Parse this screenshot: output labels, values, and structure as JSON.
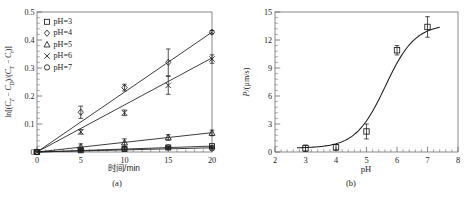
{
  "figure": {
    "panel_a_caption": "(a)",
    "panel_b_caption": "(b)"
  },
  "chart_data": [
    {
      "id": "panel-a",
      "type": "scatter",
      "title": "",
      "xlabel": "时间/min",
      "ylabel": "ln[(CT − CD)/(CT − Ct)]",
      "ylabel_parts": {
        "prefix": "ln[(",
        "c1_base": "C",
        "c1_sub": "T",
        "minus1": " − ",
        "c2_base": "C",
        "c2_sub": "D",
        "slash": ")/(",
        "c3_base": "C",
        "c3_sub": "T",
        "minus2": " − ",
        "c4_base": "C",
        "c4_sub": "t",
        "suffix": ")]"
      },
      "xlim": [
        0,
        20
      ],
      "ylim": [
        0,
        0.5
      ],
      "xticks": [
        0,
        5,
        10,
        15,
        20
      ],
      "xticklabels": [
        "0",
        "5",
        "10",
        "15",
        "20"
      ],
      "yticks": [
        0,
        0.1,
        0.2,
        0.3,
        0.4,
        0.5
      ],
      "yticklabels": [
        "0",
        "0.1",
        "0.2",
        "0.3",
        "0.4",
        "0.5"
      ],
      "minor_ticks": true,
      "grid": false,
      "legend_position": "upper-left",
      "x": [
        0,
        5,
        10,
        15,
        20
      ],
      "series": [
        {
          "name": "pH=3",
          "marker": "square",
          "values": [
            0,
            0.006,
            0.011,
            0.016,
            0.021
          ],
          "errors": [
            0,
            0.004,
            0.004,
            0.004,
            0.003
          ],
          "fit_slope": 0.00105,
          "fit_intercept": 0
        },
        {
          "name": "pH=4",
          "marker": "diamond",
          "values": [
            0,
            0.142,
            0.23,
            0.32,
            0.428
          ],
          "errors": [
            0,
            0.022,
            0.012,
            0.048,
            0.006
          ],
          "fit_slope": 0.0214,
          "fit_intercept": 0
        },
        {
          "name": "pH=5",
          "marker": "triangle",
          "values": [
            0,
            0.019,
            0.034,
            0.052,
            0.068
          ],
          "errors": [
            0,
            0.01,
            0.013,
            0.01,
            0.01
          ],
          "fit_slope": 0.00345,
          "fit_intercept": 0
        },
        {
          "name": "pH=6",
          "marker": "cross",
          "values": [
            0,
            0.072,
            0.14,
            0.238,
            0.332
          ],
          "errors": [
            0,
            0.008,
            0.01,
            0.032,
            0.015
          ],
          "fit_slope": 0.0168,
          "fit_intercept": 0
        },
        {
          "name": "pH=7",
          "marker": "circle",
          "values": [
            0,
            0.007,
            0.012,
            0.017,
            0.013
          ],
          "errors": [
            0,
            0.003,
            0.003,
            0.003,
            0.003
          ],
          "fit_slope": 0.00075,
          "fit_intercept": 0
        }
      ]
    },
    {
      "id": "panel-b",
      "type": "line",
      "title": "",
      "xlabel": "pH",
      "ylabel": "P/(μm/s)",
      "ylabel_parts": {
        "symbol": "P",
        "units": "/(μm/s)"
      },
      "xlim": [
        2,
        8
      ],
      "ylim": [
        0,
        15
      ],
      "xticks": [
        2,
        3,
        4,
        5,
        6,
        7,
        8
      ],
      "xticklabels": [
        "2",
        "3",
        "4",
        "5",
        "6",
        "7",
        "8"
      ],
      "yticks": [
        0,
        3,
        6,
        9,
        12,
        15
      ],
      "yticklabels": [
        "0",
        "3",
        "6",
        "9",
        "12",
        "15"
      ],
      "minor_ticks": true,
      "grid": false,
      "legend_position": "none",
      "marker": "square",
      "x": [
        3,
        4,
        5,
        6,
        7
      ],
      "values": [
        0.4,
        0.5,
        2.2,
        10.9,
        13.4
      ],
      "errors": [
        0.35,
        0.3,
        0.8,
        0.5,
        1.1
      ],
      "curve_description": "sigmoid fit through points"
    }
  ]
}
